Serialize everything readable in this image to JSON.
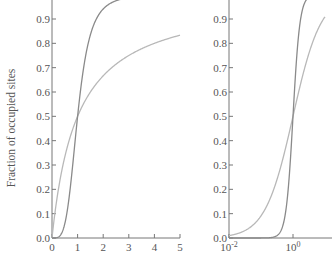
{
  "chart_data": [
    {
      "type": "line",
      "title": "",
      "xlabel": "",
      "ylabel": "Fraction of occupied sites",
      "xscale": "linear",
      "xlim": [
        0,
        5
      ],
      "ylim": [
        0.0,
        1.0
      ],
      "xticks": [
        0,
        1,
        2,
        3,
        4,
        5
      ],
      "xtick_labels": [
        "0",
        "1",
        "2",
        "3",
        "4",
        "5"
      ],
      "yticks": [
        0.0,
        0.1,
        0.2,
        0.3,
        0.4,
        0.5,
        0.6,
        0.7,
        0.8,
        0.9
      ],
      "ytick_labels": [
        "0.0",
        "0.1",
        "0.2",
        "0.3",
        "0.4",
        "0.5",
        "0.6",
        "0.7",
        "0.8",
        "0.9"
      ],
      "grid": false,
      "series": [
        {
          "name": "Hill n=1",
          "function": "x^n/(1+x^n)",
          "n": 1,
          "color": "#b8b8b8",
          "x": [
            0,
            0.5,
            1,
            2,
            3,
            4,
            5
          ],
          "values": [
            0,
            0.333,
            0.5,
            0.667,
            0.75,
            0.8,
            0.833
          ]
        },
        {
          "name": "Hill n=4",
          "function": "x^n/(1+x^n)",
          "n": 4,
          "color": "#8a8a8a",
          "x": [
            0,
            0.5,
            1,
            1.5,
            2,
            3,
            5
          ],
          "values": [
            0,
            0.059,
            0.5,
            0.835,
            0.941,
            0.988,
            0.998
          ]
        }
      ]
    },
    {
      "type": "line",
      "title": "",
      "xlabel": "",
      "ylabel": "",
      "xscale": "log",
      "xlim": [
        0.01,
        10
      ],
      "ylim": [
        0.0,
        1.0
      ],
      "xticks": [
        0.01,
        1
      ],
      "xtick_labels": [
        {
          "base": "10",
          "exp": "-2"
        },
        {
          "base": "10",
          "exp": "0"
        }
      ],
      "yticks": [
        0.0,
        0.1,
        0.2,
        0.3,
        0.4,
        0.5,
        0.6,
        0.7,
        0.8,
        0.9
      ],
      "ytick_labels": [
        "0.0",
        "0.1",
        "0.2",
        "0.3",
        "0.4",
        "0.5",
        "0.6",
        "0.7",
        "0.8",
        "0.9"
      ],
      "grid": false,
      "series": [
        {
          "name": "Hill n=1",
          "function": "x^n/(1+x^n)",
          "n": 1,
          "color": "#b8b8b8",
          "x": [
            0.01,
            0.1,
            1,
            10
          ],
          "values": [
            0.0099,
            0.091,
            0.5,
            0.909
          ]
        },
        {
          "name": "Hill n=4",
          "function": "x^n/(1+x^n)",
          "n": 4,
          "color": "#8a8a8a",
          "x": [
            0.01,
            0.1,
            0.5,
            1,
            2,
            10
          ],
          "values": [
            0.0,
            0.0001,
            0.059,
            0.5,
            0.941,
            1.0
          ]
        }
      ]
    }
  ]
}
